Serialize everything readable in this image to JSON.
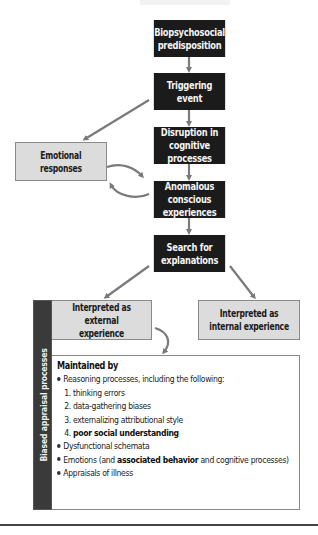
{
  "diagram": {
    "colors": {
      "dark_box": "#1b1b1b",
      "light_box": "#dcdcdc",
      "sidebar": "#3a3a3a",
      "arrow": "#7a7a7a",
      "text_light": "#f4f4f4",
      "text_dark": "#1a1a1a"
    },
    "main_flow": [
      {
        "id": "biopsychosocial",
        "line1": "Biopsychosocial",
        "line2": "predisposition"
      },
      {
        "id": "triggering",
        "line1": "Triggering event",
        "line2": ""
      },
      {
        "id": "disruption",
        "line1": "Disruption in",
        "line2": "cognitive processes"
      },
      {
        "id": "anomalous",
        "line1": "Anomalous conscious",
        "line2": "experiences"
      },
      {
        "id": "search",
        "line1": "Search for",
        "line2": "explanations"
      }
    ],
    "emotional": {
      "line1": "Emotional",
      "line2": "responses"
    },
    "interpreted_external": {
      "line1": "Interpreted as",
      "line2": "external experience"
    },
    "interpreted_internal": {
      "line1": "Interpreted as",
      "line2": "internal experience"
    },
    "sidebar_label": "Biased appraisal processes",
    "maintained": {
      "heading": "Maintained by",
      "bullet1": "Reasoning processes, including the following:",
      "sub1": "1. thinking errors",
      "sub2": "2. data-gathering biases",
      "sub3": "3. externalizing attributional style",
      "sub4_prefix": "4. ",
      "sub4_bold": "poor social understanding",
      "bullet2": "Dysfunctional schemata",
      "bullet3_prefix": "Emotions (and ",
      "bullet3_bold": "associated behavior",
      "bullet3_suffix": " and cognitive processes)",
      "bullet4": "Appraisals of illness"
    }
  }
}
